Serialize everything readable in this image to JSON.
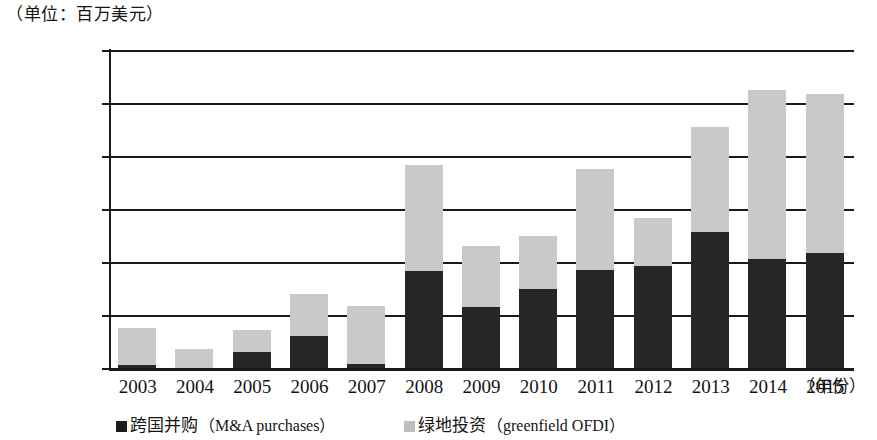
{
  "unit_caption": "（单位：百万美元）",
  "x_axis_title": "（年份）",
  "legend": {
    "ma": {
      "cn": "跨国并购",
      "en": "（M&A purchases）",
      "color": "#1c1c1c"
    },
    "greenfield": {
      "cn": "绿地投资",
      "en": "（greenfield OFDI）",
      "color": "#bfbfbf"
    }
  },
  "y_ticks": [
    "0",
    "20000",
    "40000",
    "60000",
    "80000",
    "100000",
    "120000"
  ],
  "x_ticks": [
    "2003",
    "2004",
    "2005",
    "2006",
    "2007",
    "2008",
    "2009",
    "2010",
    "2011",
    "2012",
    "2013",
    "2014",
    "2015"
  ],
  "chart_data": {
    "type": "bar",
    "stacked": true,
    "title": "",
    "subtitle": "",
    "unit": "（单位：百万美元）",
    "xlabel": "（年份）",
    "ylabel": "",
    "ylim": [
      0,
      120000
    ],
    "ytick_step": 20000,
    "grid": true,
    "legend_position": "bottom",
    "categories": [
      "2003",
      "2004",
      "2005",
      "2006",
      "2007",
      "2008",
      "2009",
      "2010",
      "2011",
      "2012",
      "2013",
      "2014",
      "2015"
    ],
    "series": [
      {
        "name": "跨国并购（M&A purchases）",
        "color": "#262626",
        "values": [
          1000,
          0,
          6000,
          12000,
          1500,
          36500,
          23000,
          30000,
          37000,
          38500,
          51500,
          41000,
          43500
        ]
      },
      {
        "name": "绿地投资（greenfield OFDI）",
        "color": "#c9c9c9",
        "values": [
          14000,
          7000,
          8500,
          16000,
          22000,
          40000,
          23000,
          20000,
          38000,
          18000,
          39500,
          64000,
          60000
        ]
      }
    ],
    "totals": [
      15000,
      7000,
      14500,
      28000,
      23500,
      76500,
      46000,
      50000,
      75000,
      56500,
      91000,
      105000,
      103500
    ]
  }
}
